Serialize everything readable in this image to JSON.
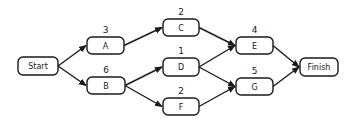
{
  "diagram": {
    "type": "activity-network",
    "colors": {
      "stroke": "#1a1a1a",
      "node_fill": "#ffffff",
      "background": "#ffffff"
    },
    "nodes": [
      {
        "id": "start",
        "label": "Start",
        "duration": "",
        "x": 18,
        "y": 57,
        "w": 40,
        "h": 18
      },
      {
        "id": "a",
        "label": "A",
        "duration": "3",
        "x": 87,
        "y": 37,
        "w": 37,
        "h": 17
      },
      {
        "id": "b",
        "label": "B",
        "duration": "6",
        "x": 87,
        "y": 77,
        "w": 38,
        "h": 17
      },
      {
        "id": "c",
        "label": "C",
        "duration": "2",
        "x": 163,
        "y": 19,
        "w": 36,
        "h": 17
      },
      {
        "id": "d",
        "label": "D",
        "duration": "1",
        "x": 163,
        "y": 58,
        "w": 36,
        "h": 18
      },
      {
        "id": "f",
        "label": "F",
        "duration": "2",
        "x": 163,
        "y": 98,
        "w": 36,
        "h": 17
      },
      {
        "id": "e",
        "label": "E",
        "duration": "4",
        "x": 236,
        "y": 37,
        "w": 37,
        "h": 17
      },
      {
        "id": "g",
        "label": "G",
        "duration": "5",
        "x": 236,
        "y": 78,
        "w": 37,
        "h": 17
      },
      {
        "id": "finish",
        "label": "Finish",
        "duration": "",
        "x": 300,
        "y": 58,
        "w": 38,
        "h": 18
      }
    ],
    "edges": [
      {
        "from": "start",
        "to": "a"
      },
      {
        "from": "start",
        "to": "b"
      },
      {
        "from": "a",
        "to": "c"
      },
      {
        "from": "b",
        "to": "d"
      },
      {
        "from": "b",
        "to": "f"
      },
      {
        "from": "c",
        "to": "e"
      },
      {
        "from": "d",
        "to": "e"
      },
      {
        "from": "d",
        "to": "g"
      },
      {
        "from": "f",
        "to": "g"
      },
      {
        "from": "e",
        "to": "finish"
      },
      {
        "from": "g",
        "to": "finish"
      }
    ]
  }
}
